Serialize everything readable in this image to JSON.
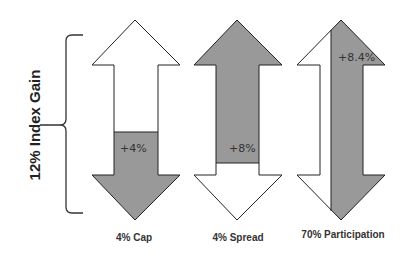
{
  "axis_label": "12% Index Gain",
  "colors": {
    "fill": "#999999",
    "stroke": "#222222",
    "background": "#ffffff"
  },
  "arrows": [
    {
      "caption": "4% Cap",
      "value_label": "+4%",
      "description": "Lower portion shaded"
    },
    {
      "caption": "4% Spread",
      "value_label": "+8%",
      "description": "Upper portion shaded"
    },
    {
      "caption": "70% Participation",
      "value_label": "+8.4%",
      "description": "Right portion shaded vertically"
    }
  ]
}
